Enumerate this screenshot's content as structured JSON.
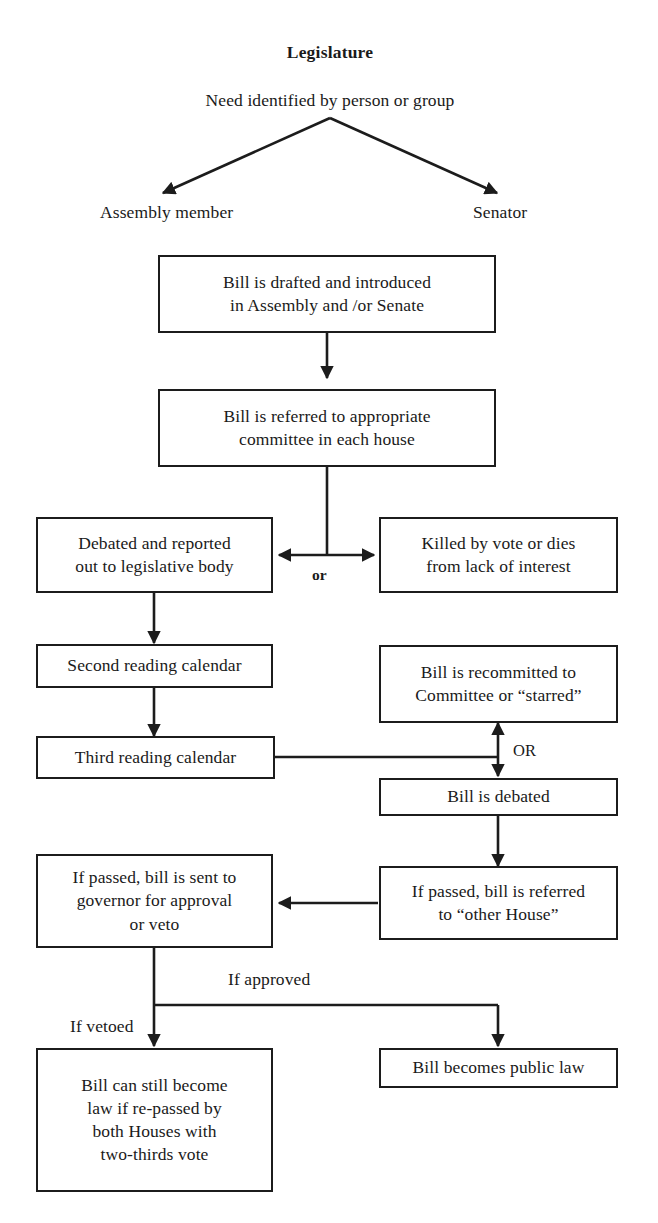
{
  "diagram": {
    "title": "Legislature",
    "type": "flowchart",
    "background_color": "#ffffff",
    "line_color": "#1c1c1c",
    "text_color": "#1a1a1a"
  },
  "header": {
    "title": "Legislature",
    "origin_text": "Need identified by person or group"
  },
  "actors": {
    "left": "Assembly member",
    "right": "Senator"
  },
  "nodes": {
    "drafted": {
      "line1": "Bill is drafted and introduced",
      "line2": "in Assembly and /or Senate"
    },
    "referred": {
      "line1": "Bill is referred to appropriate",
      "line2": "committee in each house"
    },
    "debated_reported": {
      "line1": "Debated and reported",
      "line2": "out to legislative body"
    },
    "killed": {
      "line1": "Killed by vote or dies",
      "line2": "from lack of interest"
    },
    "second_reading": {
      "line1": "Second reading calendar"
    },
    "third_reading": {
      "line1": "Third reading calendar"
    },
    "recommitted": {
      "line1": "Bill is recommitted to",
      "line2": "Committee or “starred”"
    },
    "bill_debated": {
      "line1": "Bill is debated"
    },
    "to_governor": {
      "line1": "If passed, bill is sent to",
      "line2": "governor for approval",
      "line3": "or veto"
    },
    "other_house": {
      "line1": "If passed, bill is referred",
      "line2": "to “other House”"
    },
    "repassed": {
      "line1": "Bill can still become",
      "line2": "law if re-passed by",
      "line3": "both Houses with",
      "line4": "two-thirds vote"
    },
    "public_law": {
      "line1": "Bill becomes public law"
    }
  },
  "edge_labels": {
    "or_lower": "or",
    "or_upper": "OR",
    "if_approved": "If approved",
    "if_vetoed": "If vetoed"
  }
}
